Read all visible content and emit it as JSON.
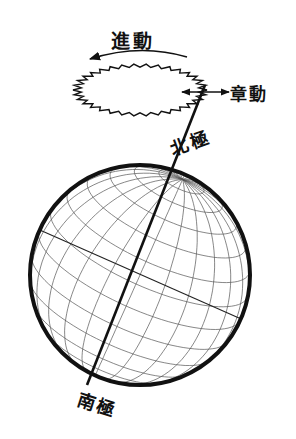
{
  "diagram": {
    "type": "earth-axis-precession-nutation",
    "labels": {
      "precession": "進動",
      "nutation": "章動",
      "north_pole": "北極",
      "south_pole": "南極"
    },
    "colors": {
      "line": "#111111",
      "grid": "#555555",
      "background": "#ffffff"
    },
    "globe": {
      "cx": 140,
      "cy": 275,
      "r": 110,
      "meridians": 12,
      "parallels": 14
    },
    "axis": {
      "x1": 205,
      "y1": 85,
      "x2": 87,
      "y2": 385
    },
    "precession_cone": {
      "cx": 140,
      "cy": 90,
      "rx": 67,
      "ry": 26,
      "wave_count": 34
    }
  }
}
